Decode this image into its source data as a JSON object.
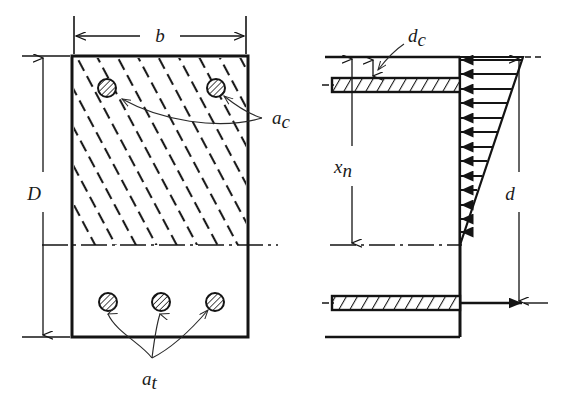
{
  "figure": {
    "labels": {
      "width_b": "b",
      "depth_D": "D",
      "effective_depth_d": "d",
      "neutral_axis_xn": "x",
      "neutral_axis_xn_sub": "n",
      "cover_dc": "d",
      "cover_dc_sub": "c",
      "compression_steel_a": "a",
      "compression_steel_sub": "c",
      "tension_steel_a": "a",
      "tension_steel_sub": "t"
    },
    "colors": {
      "ink": "#141414",
      "hatch": "#1a1a1a",
      "background": "#ffffff"
    },
    "left_section": {
      "name": "beam-cross-section",
      "rect": {
        "x": 72,
        "y": 56,
        "width": 176,
        "height": 281
      },
      "compression_zone_hatched": true,
      "neutral_axis_y": 245,
      "compression_bars": [
        {
          "cx": 107,
          "cy": 88,
          "r": 9
        },
        {
          "cx": 216,
          "cy": 88,
          "r": 9
        }
      ],
      "tension_bars": [
        {
          "cx": 108,
          "cy": 302,
          "r": 9
        },
        {
          "cx": 161,
          "cy": 302,
          "r": 9
        },
        {
          "cx": 215,
          "cy": 302,
          "r": 9
        }
      ]
    },
    "right_section": {
      "name": "stress-distribution-diagram",
      "top_y": 57,
      "bottom_y": 337,
      "neutral_axis_y": 245,
      "section_left_x": 325,
      "section_right_x": 460,
      "compression_steel_band": {
        "x": 332,
        "y": 78,
        "width": 128,
        "height": 14
      },
      "tension_steel_band": {
        "x": 332,
        "y": 296,
        "width": 128,
        "height": 14
      },
      "stress_block": {
        "apex_y": 245,
        "top_y": 57,
        "max_width": 63,
        "arrow_count": 13,
        "direction": "left"
      },
      "tension_force_arrow": {
        "x1": 460,
        "y": 303,
        "x2": 520
      }
    }
  }
}
